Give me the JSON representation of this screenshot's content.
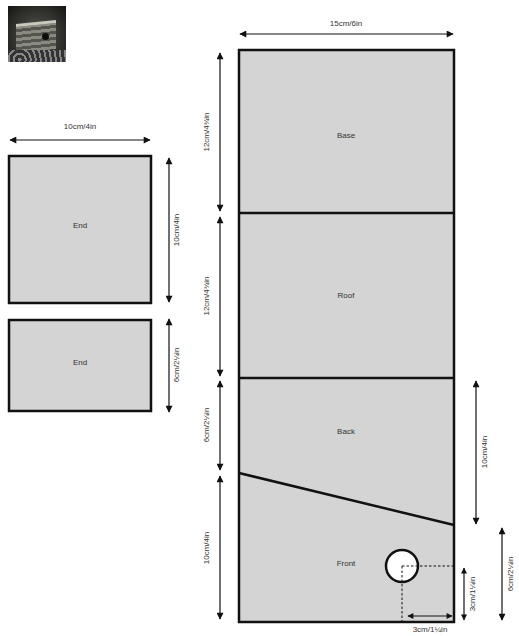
{
  "photo": {
    "alt": "birdhouse-photo"
  },
  "end_panels": [
    {
      "label": "End",
      "width_dim": "10cm/4in",
      "height_dim": "10cm/4in"
    },
    {
      "label": "End",
      "height_dim": "6cm/2¼in"
    }
  ],
  "main_panel": {
    "width_dim": "15cm/6in",
    "sections": [
      {
        "label": "Base",
        "height_dim": "12cm/4¾in"
      },
      {
        "label": "Roof",
        "height_dim": "12cm/4¾in"
      },
      {
        "label": "Back",
        "height_dim": "6cm/2¼in"
      },
      {
        "label": "Front",
        "height_dim": "10cm/4in"
      }
    ],
    "right_dims": {
      "back_height": "10cm/4in",
      "front_height": "6cm/2¼in",
      "hole_from_bottom": "3cm/1¼in",
      "hole_from_side": "3cm/1¼in"
    }
  },
  "colors": {
    "panel_fill": "#d4d4d4",
    "outline": "#111111",
    "text": "#333333"
  }
}
